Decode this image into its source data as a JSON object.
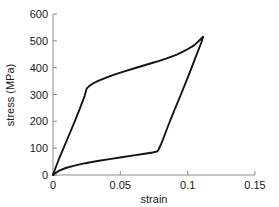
{
  "chart_data": {
    "type": "line",
    "title": "",
    "xlabel": "strain",
    "ylabel": "stress (MPa)",
    "xlim": [
      0,
      0.15
    ],
    "ylim": [
      0,
      600
    ],
    "xticks": [
      0,
      0.05,
      0.1,
      0.15
    ],
    "xtick_labels": [
      "0",
      "0.05",
      "0.1",
      "0.15"
    ],
    "yticks": [
      0,
      100,
      200,
      300,
      400,
      500,
      600
    ],
    "ytick_labels": [
      "0",
      "100",
      "200",
      "300",
      "400",
      "500",
      "600"
    ],
    "grid": false,
    "legend": null,
    "line_color": "#141414",
    "series": [
      {
        "name": "loading-branch",
        "x": [
          0.0,
          0.002,
          0.005,
          0.008,
          0.012,
          0.016,
          0.02,
          0.0235,
          0.025,
          0.027,
          0.03,
          0.034,
          0.04,
          0.046,
          0.053,
          0.06,
          0.068,
          0.076,
          0.084,
          0.092,
          0.099,
          0.105,
          0.109,
          0.1115
        ],
        "y": [
          0,
          28,
          67,
          102,
          150,
          198,
          248,
          295,
          322,
          332,
          342,
          352,
          364,
          375,
          386,
          397,
          409,
          421,
          434,
          449,
          466,
          484,
          503,
          515
        ]
      },
      {
        "name": "unloading-branch",
        "x": [
          0.1115,
          0.11,
          0.106,
          0.101,
          0.095,
          0.09,
          0.086,
          0.083,
          0.0805,
          0.0785,
          0.0775,
          0.074,
          0.068,
          0.06,
          0.051,
          0.042,
          0.033,
          0.024,
          0.016,
          0.01,
          0.005,
          0.002,
          0.0
        ],
        "y": [
          515,
          492,
          440,
          375,
          300,
          240,
          190,
          150,
          118,
          96,
          88,
          84,
          79,
          73,
          66,
          59,
          52,
          44,
          35,
          27,
          17,
          8,
          0
        ]
      }
    ]
  },
  "axis_geometry": {
    "origin_x_px": 53,
    "origin_y_px": 175,
    "x_right_px": 255,
    "y_top_px": 14
  }
}
